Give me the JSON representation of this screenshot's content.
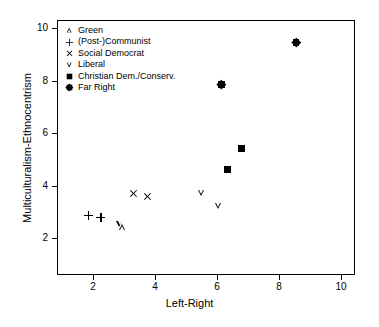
{
  "chart_data": {
    "type": "scatter",
    "title": "",
    "xlabel": "Left-Right",
    "ylabel": "Multiculturalism-Ethnocentrism",
    "xlim": [
      1,
      10.4
    ],
    "ylim": [
      1.1,
      10.3
    ],
    "xticks": [
      2,
      4,
      6,
      8,
      10
    ],
    "yticks": [
      2,
      4,
      6,
      8,
      10
    ],
    "grid": false,
    "legend_position": "top-left",
    "series": [
      {
        "name": "Green",
        "marker": "triangle-up-open",
        "points": [
          {
            "x": 2.95,
            "y": 2.4
          }
        ]
      },
      {
        "name": "(Post-)Communist",
        "marker": "plus",
        "points": [
          {
            "x": 1.85,
            "y": 2.85
          },
          {
            "x": 2.25,
            "y": 2.8
          }
        ]
      },
      {
        "name": "Social Democrat",
        "marker": "cross",
        "points": [
          {
            "x": 3.3,
            "y": 3.7
          },
          {
            "x": 3.75,
            "y": 3.58
          }
        ]
      },
      {
        "name": "Liberal",
        "marker": "triangle-down-open",
        "points": [
          {
            "x": 2.88,
            "y": 2.52
          },
          {
            "x": 5.5,
            "y": 3.72
          },
          {
            "x": 6.05,
            "y": 3.22
          }
        ]
      },
      {
        "name": "Christian Dem./Conserv.",
        "marker": "square-filled",
        "points": [
          {
            "x": 6.33,
            "y": 4.6
          },
          {
            "x": 6.8,
            "y": 5.42
          }
        ]
      },
      {
        "name": "Far Right",
        "marker": "diamond-filled",
        "points": [
          {
            "x": 6.15,
            "y": 7.85
          },
          {
            "x": 8.55,
            "y": 9.45
          }
        ]
      }
    ]
  },
  "legend": {
    "items": [
      {
        "label": "Green",
        "marker": "triangle-up-open"
      },
      {
        "label": "(Post-)Communist",
        "marker": "plus"
      },
      {
        "label": "Social Democrat",
        "marker": "cross"
      },
      {
        "label": "Liberal",
        "marker": "triangle-down-open"
      },
      {
        "label": "Christian Dem./Conserv.",
        "marker": "square-filled"
      },
      {
        "label": "Far Right",
        "marker": "diamond-filled"
      }
    ]
  },
  "axes": {
    "x_tick_labels": [
      "2",
      "4",
      "6",
      "8",
      "10"
    ],
    "y_tick_labels": [
      "2",
      "4",
      "6",
      "8",
      "10"
    ],
    "x_title": "Left-Right",
    "y_title": "Multiculturalism-Ethnocentrism"
  },
  "colors": {
    "foreground": "#000000",
    "background": "#ffffff"
  }
}
